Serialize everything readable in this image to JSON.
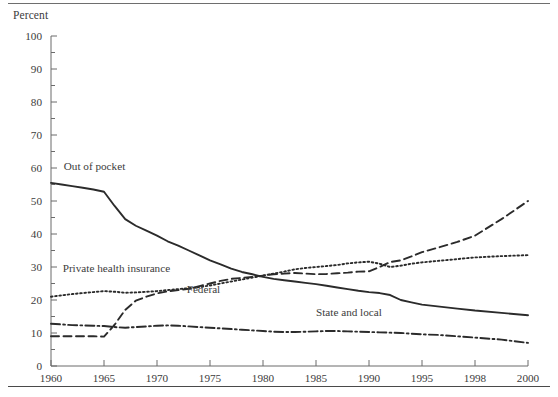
{
  "figure": {
    "y_axis_title": "Percent",
    "top_rule": "horizontal-rule",
    "bottom_rule": "horizontal-rule"
  },
  "chart_data": {
    "type": "line",
    "title": "",
    "subtitle": "",
    "xlabel": "",
    "ylabel": "Percent",
    "ylim": [
      0,
      100
    ],
    "yticks": [
      0,
      10,
      20,
      30,
      40,
      50,
      60,
      70,
      80,
      90,
      100
    ],
    "yticks_minor": [
      5,
      15,
      25,
      35,
      45,
      55,
      65,
      75,
      85,
      95
    ],
    "xticklabels": [
      "1960",
      "1965",
      "1970",
      "1975",
      "1980",
      "1985",
      "1990",
      "1995",
      "1998",
      "2000"
    ],
    "x": [
      1960,
      1965,
      1970,
      1975,
      1980,
      1985,
      1990,
      1995,
      1998,
      2000
    ],
    "grid": false,
    "legend_position": "inline-annotations",
    "series": [
      {
        "name": "Out of pocket",
        "style": "solid",
        "label_x": 1961.2,
        "label_y": 59.5,
        "x": [
          1960,
          1961,
          1962,
          1963,
          1964,
          1965,
          1966,
          1967,
          1968,
          1969,
          1970,
          1971,
          1972,
          1973,
          1974,
          1975,
          1976,
          1977,
          1978,
          1979,
          1980,
          1981,
          1982,
          1983,
          1984,
          1985,
          1986,
          1987,
          1988,
          1989,
          1990,
          1991,
          1992,
          1993,
          1994,
          1995,
          1996,
          1997,
          1998,
          1999,
          2000
        ],
        "values": [
          55.5,
          55.0,
          54.5,
          54.0,
          53.5,
          52.8,
          48.5,
          44.5,
          42.5,
          41.0,
          39.5,
          37.8,
          36.5,
          35.0,
          33.5,
          32.0,
          30.8,
          29.5,
          28.5,
          27.8,
          27.0,
          26.4,
          26.0,
          25.6,
          25.2,
          24.8,
          24.3,
          23.8,
          23.3,
          22.8,
          22.4,
          22.1,
          21.5,
          20.0,
          19.3,
          18.6,
          18.0,
          17.4,
          16.8,
          16.1,
          15.4
        ]
      },
      {
        "name": "Private health insurance",
        "style": "dotted",
        "label_x": 1961.1,
        "label_y": 28.4,
        "x": [
          1960,
          1961,
          1962,
          1963,
          1964,
          1965,
          1966,
          1967,
          1968,
          1969,
          1970,
          1971,
          1972,
          1973,
          1974,
          1975,
          1976,
          1977,
          1978,
          1979,
          1980,
          1981,
          1982,
          1983,
          1984,
          1985,
          1986,
          1987,
          1988,
          1989,
          1990,
          1991,
          1992,
          1993,
          1994,
          1995,
          1996,
          1997,
          1998,
          1999,
          2000
        ],
        "values": [
          21.0,
          21.4,
          21.8,
          22.1,
          22.4,
          22.7,
          22.5,
          22.2,
          22.3,
          22.5,
          22.7,
          23.0,
          23.3,
          23.6,
          23.9,
          24.4,
          25.0,
          25.6,
          26.2,
          26.8,
          27.4,
          28.0,
          28.6,
          29.3,
          29.7,
          30.0,
          30.3,
          30.6,
          31.1,
          31.4,
          31.6,
          31.0,
          30.0,
          30.4,
          31.0,
          31.4,
          31.9,
          32.4,
          32.9,
          33.3,
          33.6
        ]
      },
      {
        "name": "Federal",
        "style": "dashed",
        "label_x": 1972.8,
        "label_y": 22.0,
        "x": [
          1960,
          1961,
          1962,
          1963,
          1964,
          1965,
          1966,
          1967,
          1968,
          1969,
          1970,
          1971,
          1972,
          1973,
          1974,
          1975,
          1976,
          1977,
          1978,
          1979,
          1980,
          1981,
          1982,
          1983,
          1984,
          1985,
          1986,
          1987,
          1988,
          1989,
          1990,
          1991,
          1992,
          1993,
          1994,
          1995,
          1996,
          1997,
          1998,
          1999,
          2000
        ],
        "values": [
          9.0,
          9.0,
          9.0,
          9.0,
          9.0,
          8.9,
          12.5,
          17.0,
          19.8,
          21.0,
          22.0,
          22.6,
          23.0,
          23.4,
          24.2,
          25.0,
          25.8,
          26.4,
          26.7,
          27.0,
          27.4,
          27.8,
          28.0,
          28.2,
          28.0,
          27.8,
          27.9,
          28.1,
          28.3,
          28.6,
          28.7,
          30.0,
          31.5,
          32.0,
          33.2,
          34.5,
          36.0,
          37.6,
          39.5,
          44.5,
          50.0
        ]
      },
      {
        "name": "State and local",
        "style": "dashdot",
        "label_x": 1985.0,
        "label_y": 15.2,
        "x": [
          1960,
          1961,
          1962,
          1963,
          1964,
          1965,
          1966,
          1967,
          1968,
          1969,
          1970,
          1971,
          1972,
          1973,
          1974,
          1975,
          1976,
          1977,
          1978,
          1979,
          1980,
          1981,
          1982,
          1983,
          1984,
          1985,
          1986,
          1987,
          1988,
          1989,
          1990,
          1991,
          1992,
          1993,
          1994,
          1995,
          1996,
          1997,
          1998,
          1999,
          2000
        ],
        "values": [
          12.8,
          12.6,
          12.4,
          12.3,
          12.2,
          12.1,
          11.8,
          11.6,
          11.8,
          12.0,
          12.2,
          12.3,
          12.2,
          12.0,
          11.8,
          11.6,
          11.4,
          11.2,
          11.0,
          10.8,
          10.6,
          10.4,
          10.3,
          10.3,
          10.4,
          10.5,
          10.6,
          10.6,
          10.5,
          10.4,
          10.3,
          10.2,
          10.1,
          10.0,
          9.8,
          9.6,
          9.4,
          9.0,
          8.6,
          8.0,
          7.0
        ]
      }
    ]
  }
}
